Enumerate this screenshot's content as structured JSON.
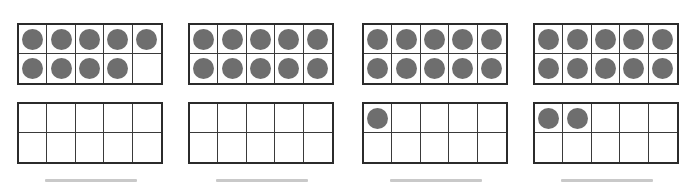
{
  "worksheet": {
    "title": "Ten Frames Counting Worksheet",
    "dot_color": "#6e6e6e",
    "frame_border_color": "#2b2b2b",
    "answer_line_color": "#c9c9c9",
    "background_color": "#ffffff"
  },
  "problems": [
    {
      "id": "problem-1",
      "frames": [
        {
          "name": "top-frame",
          "filled_count": 9,
          "cells": [
            {
              "filled": true
            },
            {
              "filled": true
            },
            {
              "filled": true
            },
            {
              "filled": true
            },
            {
              "filled": true
            },
            {
              "filled": true
            },
            {
              "filled": true
            },
            {
              "filled": true
            },
            {
              "filled": true
            },
            {
              "filled": false
            }
          ]
        },
        {
          "name": "bottom-frame",
          "filled_count": 0,
          "cells": [
            {
              "filled": false
            },
            {
              "filled": false
            },
            {
              "filled": false
            },
            {
              "filled": false
            },
            {
              "filled": false
            },
            {
              "filled": false
            },
            {
              "filled": false
            },
            {
              "filled": false
            },
            {
              "filled": false
            },
            {
              "filled": false
            }
          ]
        }
      ],
      "total": 9,
      "answer_text": ""
    },
    {
      "id": "problem-2",
      "frames": [
        {
          "name": "top-frame",
          "filled_count": 10,
          "cells": [
            {
              "filled": true
            },
            {
              "filled": true
            },
            {
              "filled": true
            },
            {
              "filled": true
            },
            {
              "filled": true
            },
            {
              "filled": true
            },
            {
              "filled": true
            },
            {
              "filled": true
            },
            {
              "filled": true
            },
            {
              "filled": true
            }
          ]
        },
        {
          "name": "bottom-frame",
          "filled_count": 0,
          "cells": [
            {
              "filled": false
            },
            {
              "filled": false
            },
            {
              "filled": false
            },
            {
              "filled": false
            },
            {
              "filled": false
            },
            {
              "filled": false
            },
            {
              "filled": false
            },
            {
              "filled": false
            },
            {
              "filled": false
            },
            {
              "filled": false
            }
          ]
        }
      ],
      "total": 10,
      "answer_text": ""
    },
    {
      "id": "problem-3",
      "frames": [
        {
          "name": "top-frame",
          "filled_count": 10,
          "cells": [
            {
              "filled": true
            },
            {
              "filled": true
            },
            {
              "filled": true
            },
            {
              "filled": true
            },
            {
              "filled": true
            },
            {
              "filled": true
            },
            {
              "filled": true
            },
            {
              "filled": true
            },
            {
              "filled": true
            },
            {
              "filled": true
            }
          ]
        },
        {
          "name": "bottom-frame",
          "filled_count": 1,
          "cells": [
            {
              "filled": true
            },
            {
              "filled": false
            },
            {
              "filled": false
            },
            {
              "filled": false
            },
            {
              "filled": false
            },
            {
              "filled": false
            },
            {
              "filled": false
            },
            {
              "filled": false
            },
            {
              "filled": false
            },
            {
              "filled": false
            }
          ]
        }
      ],
      "total": 11,
      "answer_text": ""
    },
    {
      "id": "problem-4",
      "frames": [
        {
          "name": "top-frame",
          "filled_count": 10,
          "cells": [
            {
              "filled": true
            },
            {
              "filled": true
            },
            {
              "filled": true
            },
            {
              "filled": true
            },
            {
              "filled": true
            },
            {
              "filled": true
            },
            {
              "filled": true
            },
            {
              "filled": true
            },
            {
              "filled": true
            },
            {
              "filled": true
            }
          ]
        },
        {
          "name": "bottom-frame",
          "filled_count": 2,
          "cells": [
            {
              "filled": true
            },
            {
              "filled": true
            },
            {
              "filled": false
            },
            {
              "filled": false
            },
            {
              "filled": false
            },
            {
              "filled": false
            },
            {
              "filled": false
            },
            {
              "filled": false
            },
            {
              "filled": false
            },
            {
              "filled": false
            }
          ]
        }
      ],
      "total": 12,
      "answer_text": ""
    }
  ],
  "layout": {
    "group_left_offsets": [
      17,
      188,
      362,
      533
    ]
  }
}
